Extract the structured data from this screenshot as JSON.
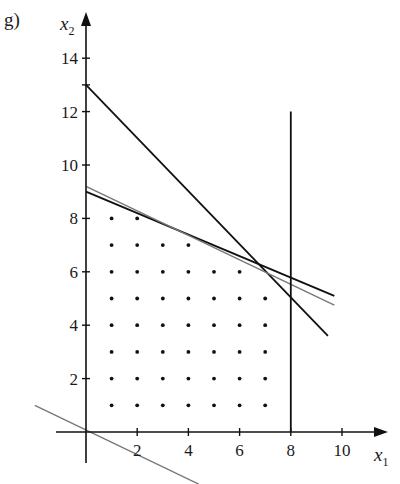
{
  "panel_label": "g)",
  "chart_data": {
    "type": "line",
    "title": "",
    "xlabel": "x1",
    "ylabel": "x2",
    "xlabel_main": "x",
    "xlabel_sub": "1",
    "ylabel_main": "x",
    "ylabel_sub": "2",
    "xlim": [
      -1,
      11.5
    ],
    "ylim": [
      -2,
      15
    ],
    "grid": false,
    "legend": null,
    "x_ticks": [
      2,
      4,
      6,
      8,
      10
    ],
    "x_tick_labels": [
      "2",
      "4",
      "6",
      "8",
      "10"
    ],
    "y_ticks": [
      2,
      4,
      6,
      8,
      10,
      12,
      14
    ],
    "y_tick_labels": [
      "2",
      "4",
      "6",
      "8",
      "10",
      "12",
      "14"
    ],
    "series": [
      {
        "name": "constraint-steep",
        "style": "black",
        "points": [
          [
            0,
            13
          ],
          [
            9.45,
            3.6
          ]
        ]
      },
      {
        "name": "constraint-shallow",
        "style": "black",
        "points": [
          [
            0,
            9.0
          ],
          [
            9.7,
            5.1
          ]
        ]
      },
      {
        "name": "objective-level",
        "style": "gray",
        "points": [
          [
            0,
            9.2
          ],
          [
            9.7,
            4.75
          ]
        ]
      },
      {
        "name": "constraint-vertical-x1=8",
        "style": "black",
        "points": [
          [
            8,
            0
          ],
          [
            8,
            12
          ]
        ]
      },
      {
        "name": "objective-through-origin",
        "style": "gray",
        "points": [
          [
            -2.0,
            1.0
          ],
          [
            4.4,
            -1.95
          ]
        ]
      }
    ],
    "integer_points": [
      [
        1,
        8
      ],
      [
        2,
        8
      ],
      [
        1,
        7
      ],
      [
        2,
        7
      ],
      [
        3,
        7
      ],
      [
        4,
        7
      ],
      [
        1,
        6
      ],
      [
        2,
        6
      ],
      [
        3,
        6
      ],
      [
        4,
        6
      ],
      [
        5,
        6
      ],
      [
        6,
        6
      ],
      [
        1,
        5
      ],
      [
        2,
        5
      ],
      [
        3,
        5
      ],
      [
        4,
        5
      ],
      [
        5,
        5
      ],
      [
        6,
        5
      ],
      [
        7,
        5
      ],
      [
        1,
        4
      ],
      [
        2,
        4
      ],
      [
        3,
        4
      ],
      [
        4,
        4
      ],
      [
        5,
        4
      ],
      [
        6,
        4
      ],
      [
        7,
        4
      ],
      [
        1,
        3
      ],
      [
        2,
        3
      ],
      [
        3,
        3
      ],
      [
        4,
        3
      ],
      [
        5,
        3
      ],
      [
        6,
        3
      ],
      [
        7,
        3
      ],
      [
        1,
        2
      ],
      [
        2,
        2
      ],
      [
        3,
        2
      ],
      [
        4,
        2
      ],
      [
        5,
        2
      ],
      [
        6,
        2
      ],
      [
        7,
        2
      ],
      [
        1,
        1
      ],
      [
        2,
        1
      ],
      [
        3,
        1
      ],
      [
        4,
        1
      ],
      [
        5,
        1
      ],
      [
        6,
        1
      ],
      [
        7,
        1
      ]
    ],
    "colors": {
      "axis": "#111111",
      "constraint": "#111111",
      "objective": "#777777",
      "dots": "#111111"
    }
  }
}
